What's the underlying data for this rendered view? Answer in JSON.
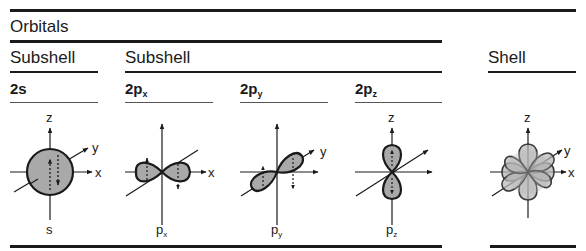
{
  "header": {
    "section_title": "Orbitals"
  },
  "columns": {
    "subshell_left_title": "Subshell",
    "subshell_right_title": "Subshell",
    "shell_title": "Shell"
  },
  "orbitals": [
    {
      "id": "2s",
      "label_main": "2s",
      "label_sub": "",
      "caption_main": "s",
      "caption_sub": "",
      "axes": [
        "z",
        "y",
        "x"
      ]
    },
    {
      "id": "2px",
      "label_main": "2p",
      "label_sub": "x",
      "caption_main": "p",
      "caption_sub": "x",
      "axes": [
        "x"
      ]
    },
    {
      "id": "2py",
      "label_main": "2p",
      "label_sub": "y",
      "caption_main": "p",
      "caption_sub": "y",
      "axes": [
        "y"
      ]
    },
    {
      "id": "2pz",
      "label_main": "2p",
      "label_sub": "z",
      "caption_main": "p",
      "caption_sub": "z",
      "axes": [
        "z"
      ]
    },
    {
      "id": "shell",
      "label_main": "",
      "label_sub": "",
      "caption_main": "",
      "caption_sub": "",
      "axes": [
        "z",
        "y",
        "x"
      ]
    }
  ],
  "axis_labels": {
    "x": "x",
    "y": "y",
    "z": "z"
  },
  "colors": {
    "ink": "#1a1a1a",
    "lobe_fill": "#a9a9a9",
    "shell_fill": "#b4b4b4"
  }
}
